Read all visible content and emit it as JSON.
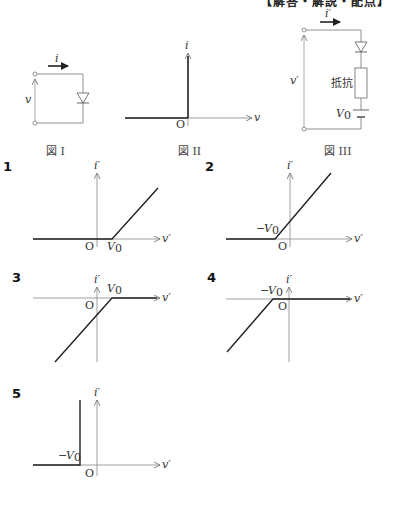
{
  "header": {
    "clipped_heading": "【解答・解説・配点】"
  },
  "figures": {
    "fig1": {
      "caption": "図 I",
      "current_label": "i",
      "voltage_label": "v"
    },
    "fig2": {
      "caption": "図 II",
      "y_axis": "i",
      "x_axis": "v",
      "origin": "O"
    },
    "fig3": {
      "caption": "図 III",
      "current_label": "i′",
      "voltage_label": "v′",
      "resistor_label": "抵抗",
      "battery_label": "V",
      "battery_sub": "0"
    }
  },
  "choices": [
    {
      "number": "1",
      "y_axis": "i′",
      "x_axis": "v′",
      "origin": "O",
      "knee_label": "V",
      "knee_sub": "0",
      "knee_sign": ""
    },
    {
      "number": "2",
      "y_axis": "i′",
      "x_axis": "v′",
      "origin": "O",
      "knee_label": "V",
      "knee_sub": "0",
      "knee_sign": "−"
    },
    {
      "number": "3",
      "y_axis": "i′",
      "x_axis": "v′",
      "origin": "O",
      "knee_label": "V",
      "knee_sub": "0",
      "knee_sign": ""
    },
    {
      "number": "4",
      "y_axis": "i′",
      "x_axis": "v′",
      "origin": "O",
      "knee_label": "V",
      "knee_sub": "0",
      "knee_sign": "−"
    },
    {
      "number": "5",
      "y_axis": "i′",
      "x_axis": "v′",
      "origin": "O",
      "knee_label": "V",
      "knee_sub": "0",
      "knee_sign": "−"
    }
  ],
  "colors": {
    "axis": "#888888",
    "curve": "#222222",
    "wire": "#666666"
  }
}
